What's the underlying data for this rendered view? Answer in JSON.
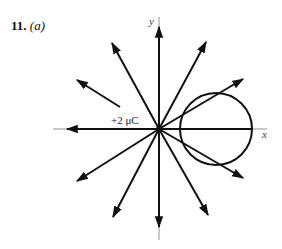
{
  "problem": {
    "number": "11.",
    "part": "(a)"
  },
  "axes": {
    "x_label": "x",
    "y_label": "y"
  },
  "charge": {
    "label": "+2 μC",
    "origin": [
      159,
      129
    ]
  },
  "gaussian_surface": {
    "shape": "circle",
    "center": [
      216,
      129
    ],
    "radius": 36
  },
  "field_lines": [
    {
      "direction": "up",
      "tip": [
        159,
        27
      ]
    },
    {
      "direction": "up-right-steep",
      "tip": [
        206,
        42
      ]
    },
    {
      "direction": "up-right-shallow",
      "tip": [
        243,
        79
      ]
    },
    {
      "direction": "right",
      "tip": [
        252,
        129
      ]
    },
    {
      "direction": "down-right-shallow",
      "tip": [
        243,
        178
      ]
    },
    {
      "direction": "down-right-steep",
      "tip": [
        208,
        215
      ]
    },
    {
      "direction": "down",
      "tip": [
        159,
        227
      ]
    },
    {
      "direction": "down-left-steep",
      "tip": [
        113,
        217
      ]
    },
    {
      "direction": "down-left-shallow",
      "tip": [
        77,
        181
      ]
    },
    {
      "direction": "left",
      "tip": [
        67,
        129
      ]
    },
    {
      "direction": "up-left-shallow",
      "tip": [
        77,
        80
      ],
      "start": [
        120,
        108
      ]
    },
    {
      "direction": "up-left-steep",
      "tip": [
        112,
        43
      ]
    }
  ],
  "colors": {
    "line": "#111111",
    "axis_thin": "#777777"
  }
}
